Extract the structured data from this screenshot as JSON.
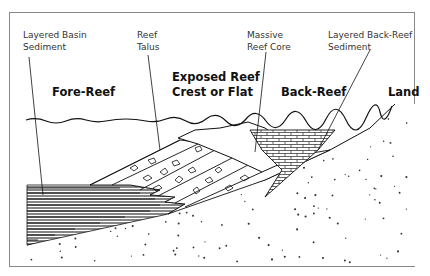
{
  "diagram": {
    "type": "geological cross-section",
    "callouts": [
      {
        "id": "layered-basin-sediment",
        "line1": "Layered Basin",
        "line2": "Sediment"
      },
      {
        "id": "reef-talus",
        "line1": "Reef",
        "line2": "Talus"
      },
      {
        "id": "massive-reef-core",
        "line1": "Massive",
        "line2": "Reef Core"
      },
      {
        "id": "layered-back-reef-sediment",
        "line1": "Layered Back-Reef",
        "line2": "Sediment"
      }
    ],
    "zones": [
      {
        "id": "fore-reef",
        "line1": "Fore-Reef"
      },
      {
        "id": "exposed-reef-crest",
        "line1": "Exposed Reef",
        "line2": "Crest or Flat"
      },
      {
        "id": "back-reef",
        "line1": "Back-Reef"
      },
      {
        "id": "land",
        "line1": "Land"
      }
    ],
    "colors": {
      "ink": "#1a1a1a",
      "frame": "#777777",
      "background": "#ffffff"
    }
  }
}
